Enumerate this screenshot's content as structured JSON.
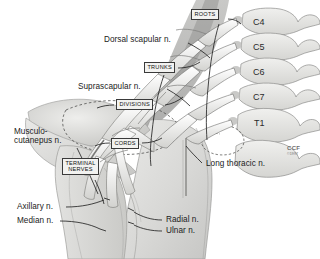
{
  "figure": {
    "background_color": "#ffffff",
    "ink_color": "#1b1b1b"
  },
  "nerve_labels": [
    {
      "id": "dorsal-scapular",
      "text": "Dorsal scapular n."
    },
    {
      "id": "suprascapular",
      "text": "Suprascapular n."
    },
    {
      "id": "musculocutaneous-line1",
      "text": "Musculo-"
    },
    {
      "id": "musculocutaneous-line2",
      "text": "cutanepus n."
    },
    {
      "id": "axillary",
      "text": "Axillary n."
    },
    {
      "id": "median",
      "text": "Median n."
    },
    {
      "id": "radial",
      "text": "Radial n."
    },
    {
      "id": "ulnar",
      "text": "Ulnar n."
    },
    {
      "id": "long-thoracic",
      "text": "Long thoracic n."
    }
  ],
  "plexus_sections": [
    {
      "id": "roots",
      "text": "ROOTS"
    },
    {
      "id": "trunks",
      "text": "TRUNKS"
    },
    {
      "id": "divisions",
      "text": "DIVISIONS"
    },
    {
      "id": "cords",
      "text": "CORDS"
    },
    {
      "id": "terminal-nerves",
      "text": "TERMINAL\nNERVES"
    }
  ],
  "vertebrae": [
    {
      "id": "c4",
      "text": "C4"
    },
    {
      "id": "c5",
      "text": "C5"
    },
    {
      "id": "c6",
      "text": "C6"
    },
    {
      "id": "c7",
      "text": "C7"
    },
    {
      "id": "t1",
      "text": "T1"
    }
  ],
  "signature": {
    "mark": "CCF",
    "year": "©1997"
  }
}
